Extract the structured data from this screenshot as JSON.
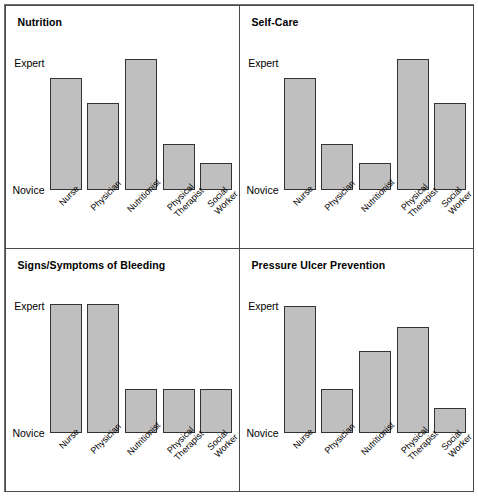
{
  "chart_data": [
    {
      "type": "bar",
      "title": "Nutrition",
      "xlabel": "",
      "ylabel": "",
      "ylim": [
        0,
        100
      ],
      "ytick_labels": [
        "Novice",
        "Expert"
      ],
      "grid": false,
      "legend": "none",
      "categories": [
        "Nurse",
        "Physician",
        "Nutritionist",
        "Physical Therapist",
        "Social Worker"
      ],
      "values": [
        88,
        68,
        103,
        36,
        21
      ]
    },
    {
      "type": "bar",
      "title": "Self-Care",
      "xlabel": "",
      "ylabel": "",
      "ylim": [
        0,
        100
      ],
      "ytick_labels": [
        "Novice",
        "Expert"
      ],
      "grid": false,
      "legend": "none",
      "categories": [
        "Nurse",
        "Physician",
        "Nutritionist",
        "Physical Therapist",
        "Social Worker"
      ],
      "values": [
        88,
        36,
        21,
        103,
        68
      ]
    },
    {
      "type": "bar",
      "title": "Signs/Symptoms of Bleeding",
      "xlabel": "",
      "ylabel": "",
      "ylim": [
        0,
        100
      ],
      "ytick_labels": [
        "Novice",
        "Expert"
      ],
      "grid": false,
      "legend": "none",
      "categories": [
        "Nurse",
        "Physician",
        "Nutritionist",
        "Physical Therapist",
        "Social Worker"
      ],
      "values": [
        101,
        101,
        34,
        34,
        34
      ]
    },
    {
      "type": "bar",
      "title": "Pressure Ulcer Prevention",
      "xlabel": "",
      "ylabel": "",
      "ylim": [
        0,
        100
      ],
      "ytick_labels": [
        "Novice",
        "Expert"
      ],
      "grid": false,
      "legend": "none",
      "categories": [
        "Nurse",
        "Physician",
        "Nutritionist",
        "Physical Therapist",
        "Social Worker"
      ],
      "values": [
        100,
        34,
        64,
        83,
        19
      ]
    }
  ],
  "axis": {
    "expert": "Expert",
    "novice": "Novice"
  },
  "tick_text": {
    "nurse": "Nurse",
    "physician": "Physician",
    "nutritionist": "Nutritionist",
    "physical_therapist": "Physical\nTherapist",
    "social_worker": "Social\nWorker"
  },
  "style": {
    "bar_fill": "#bfbfbf",
    "bar_stroke": "#333333",
    "panel_border": "#4a4a4a",
    "figure_border": "#6e6e6e",
    "background": "#ffffff",
    "text": "#000000"
  }
}
